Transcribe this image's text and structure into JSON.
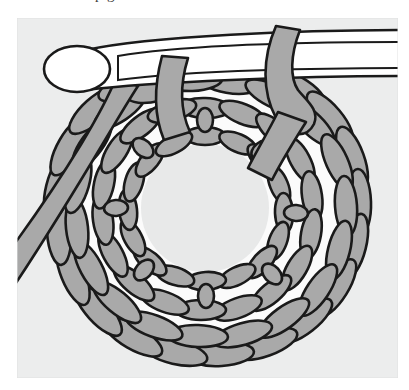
{
  "figure": {
    "kind": "instructional-illustration",
    "caption_fragment_above": "p g",
    "panel": {
      "background_color": "#eceded",
      "left": 17,
      "top": 18,
      "width": 381,
      "height": 360
    },
    "page_background_color": "#ffffff",
    "line_color": "#1a1a1a",
    "yarn_fill_color": "#a9a9a9",
    "hook_fill_color": "#ffffff",
    "center_hole_color": "#e8e9e9",
    "gap_color": "#fafafa"
  },
  "elements": {
    "hook": {
      "name": "crochet hook",
      "label": "crochet-hook",
      "description": "White metal hook with rounded head at left, shaft extending off the right edge of the panel"
    },
    "hook_head": {
      "name": "hook head",
      "label": "hook-head",
      "description": "Rounded white oval tip of the crochet hook"
    },
    "hook_shaft": {
      "name": "hook shaft",
      "label": "hook-shaft",
      "description": "Long tapering white shaft with a narrow elliptical groove"
    },
    "working_loop": {
      "name": "working loop",
      "label": "working-loop",
      "description": "Gray yarn loop wrapped over the hook shaft at the right"
    },
    "yarn_tail": {
      "name": "yarn tail",
      "label": "yarn-tail",
      "description": "Gray yarn strand running diagonally down toward the lower left corner"
    },
    "ring": {
      "name": "ring of stitches",
      "label": "stitch-ring",
      "description": "Circular ring of crocheted stitches worked around a center hole",
      "center_x": 205,
      "center_y": 208,
      "outer_radius": 155,
      "inner_radius": 62,
      "stitch_rounds": 3,
      "stitch_count_outer": 26,
      "stitch_count_middle": 22,
      "stitch_count_inner": 20
    },
    "center_hole": {
      "name": "center hole",
      "label": "center-hole",
      "description": "Open round space at the middle of the stitch ring"
    }
  }
}
